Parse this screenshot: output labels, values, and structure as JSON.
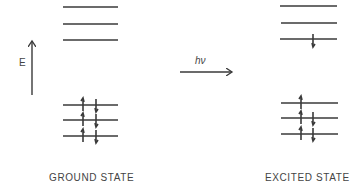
{
  "diagram": {
    "type": "energy-level diagram",
    "energy_axis": {
      "label": "E",
      "direction": "up"
    },
    "transition": {
      "label": "hν",
      "direction": "right"
    },
    "states": [
      {
        "label": "GROUND STATE",
        "upper_levels": [
          {
            "electrons": []
          },
          {
            "electrons": []
          },
          {
            "electrons": []
          }
        ],
        "lower_levels": [
          {
            "electrons": [
              "up",
              "down"
            ]
          },
          {
            "electrons": [
              "up",
              "down"
            ]
          },
          {
            "electrons": [
              "up",
              "down"
            ]
          }
        ]
      },
      {
        "label": "EXCITED STATE",
        "upper_levels": [
          {
            "electrons": []
          },
          {
            "electrons": []
          },
          {
            "electrons": [
              "down"
            ]
          }
        ],
        "lower_levels": [
          {
            "electrons": [
              "up"
            ]
          },
          {
            "electrons": [
              "up",
              "down"
            ]
          },
          {
            "electrons": [
              "up",
              "down"
            ]
          }
        ]
      }
    ],
    "colors": {
      "line": "#3a3a3a",
      "text": "#444444",
      "background": "#ffffff"
    }
  }
}
